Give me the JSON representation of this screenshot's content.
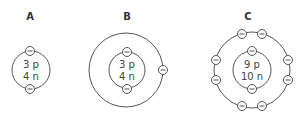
{
  "diagram": {
    "atoms": [
      {
        "label": "A",
        "protons": "3 p",
        "neutrons": "4 n",
        "shells": [
          2
        ],
        "electron_symbol": "minus"
      },
      {
        "label": "B",
        "protons": "3 p",
        "neutrons": "4 n",
        "shells": [
          2,
          1
        ],
        "electron_symbol": "minus"
      },
      {
        "label": "C",
        "protons": "9 p",
        "neutrons": "10 n",
        "shells": [
          2,
          8
        ],
        "electron_symbol": "minus"
      }
    ],
    "colors": {
      "stroke": "#555555",
      "text": "#444444",
      "background": "#ffffff"
    }
  }
}
